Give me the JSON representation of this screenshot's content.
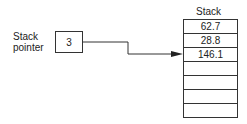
{
  "stack_title": "Stack",
  "pointer_label": [
    "Stack",
    "pointer"
  ],
  "pointer_value": "3",
  "stack_cells": [
    "62.7",
    "28.8",
    "146.1",
    "",
    "",
    "",
    ""
  ]
}
